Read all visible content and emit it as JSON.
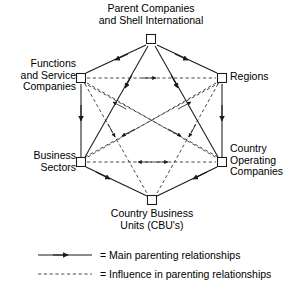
{
  "diagram": {
    "nodes": [
      {
        "id": "parent",
        "label": "Parent Companies\nand Shell International",
        "x": 151,
        "y": 39,
        "shape": "square"
      },
      {
        "id": "functions",
        "label": "Functions\nand Service\nCompanies",
        "x": 81,
        "y": 78,
        "shape": "square"
      },
      {
        "id": "regions",
        "label": "Regions",
        "x": 222,
        "y": 78,
        "shape": "square"
      },
      {
        "id": "sectors",
        "label": "Business\nSectors",
        "x": 81,
        "y": 162,
        "shape": "square"
      },
      {
        "id": "countryops",
        "label": "Country\nOperating\nCompanies",
        "x": 222,
        "y": 162,
        "shape": "square"
      },
      {
        "id": "cbu",
        "label": "Country Business\nUnits (CBU's)",
        "x": 152,
        "y": 200,
        "shape": "square"
      }
    ],
    "edges_main": [
      {
        "from": "parent",
        "to": "functions"
      },
      {
        "from": "parent",
        "to": "regions"
      },
      {
        "from": "parent",
        "to": "sectors"
      },
      {
        "from": "parent",
        "to": "countryops"
      },
      {
        "from": "functions",
        "to": "sectors"
      },
      {
        "from": "regions",
        "to": "countryops"
      },
      {
        "from": "sectors",
        "to": "cbu"
      },
      {
        "from": "countryops",
        "to": "cbu"
      }
    ],
    "edges_influence": [
      {
        "from": "functions",
        "to": "regions",
        "bidirectional": false
      },
      {
        "from": "sectors",
        "to": "countryops",
        "bidirectional": true
      },
      {
        "from": "functions",
        "to": "countryops",
        "bidirectional": false
      },
      {
        "from": "regions",
        "to": "sectors",
        "bidirectional": false
      },
      {
        "from": "functions",
        "to": "cbu",
        "bidirectional": false
      },
      {
        "from": "regions",
        "to": "cbu",
        "bidirectional": false
      },
      {
        "from": "sectors",
        "to": "regions",
        "bidirectional": false
      },
      {
        "from": "countryops",
        "to": "functions",
        "bidirectional": false
      }
    ],
    "colors": {
      "line": "#1a1a1a",
      "node_fill": "#ffffff",
      "node_stroke": "#1a1a1a",
      "text": "#000000",
      "background": "#ffffff"
    }
  },
  "labels": {
    "parent": "Parent Companies\nand Shell International",
    "functions": "Functions\nand Service\nCompanies",
    "regions": "Regions",
    "sectors": "Business\nSectors",
    "countryops": "Country\nOperating\nCompanies",
    "cbu": "Country Business\nUnits (CBU's)"
  },
  "legend": {
    "main_label": "= Main parenting relationships",
    "influence_label": "= Influence in parenting relationships"
  }
}
